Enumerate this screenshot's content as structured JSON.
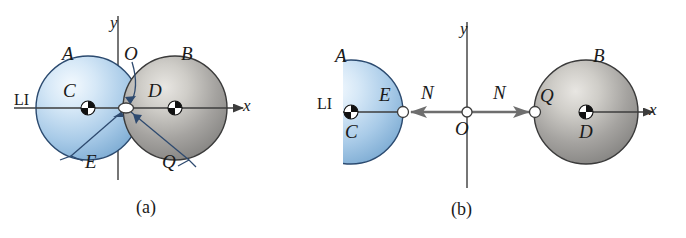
{
  "figure": {
    "type": "physics-free-body-diagram",
    "colors": {
      "sphere_a_fill": "#b9d4ec",
      "sphere_a_edge": "#2b4a6f",
      "sphere_b_fill": "#b0b0b0",
      "sphere_b_edge": "#3a3a3a",
      "axis": "#3c3c3c",
      "leader": "#2e4a6b",
      "text": "#1a1a1a",
      "background": "#ffffff"
    },
    "panels": [
      {
        "id": "a",
        "caption": "(a)",
        "axis_labels": {
          "x": "x",
          "y": "y"
        },
        "sphere_labels": {
          "sphere_a_name": "A",
          "sphere_a_center": "C",
          "sphere_b_name": "B",
          "sphere_b_center": "D"
        },
        "point_labels": {
          "origin": "O",
          "contact_left": "E",
          "contact_right": "Q"
        },
        "line_label": "LI"
      },
      {
        "id": "b",
        "caption": "(b)",
        "axis_labels": {
          "x": "x",
          "y": "y"
        },
        "sphere_labels": {
          "sphere_a_name": "A",
          "sphere_a_center": "C",
          "sphere_b_name": "B",
          "sphere_b_center": "D"
        },
        "point_labels": {
          "origin": "O",
          "contact_left": "E",
          "contact_right": "Q"
        },
        "force_labels": {
          "left": "N",
          "right": "N"
        },
        "line_label": "LI"
      }
    ]
  }
}
